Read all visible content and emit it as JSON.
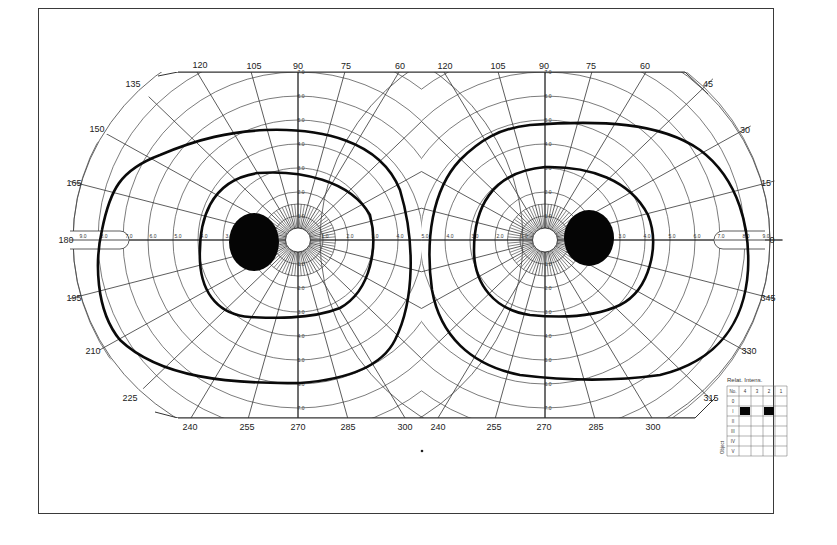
{
  "chart_data": {
    "type": "polar-perimetry",
    "grid": true,
    "eyes": [
      {
        "name": "left-eye-field",
        "center": [
          298,
          240
        ],
        "meridian_labels": [
          "120",
          "105",
          "90",
          "75",
          "60",
          "135",
          "150",
          "165",
          "180",
          "195",
          "210",
          "225",
          "240",
          "255",
          "270",
          "285",
          "300"
        ],
        "radial_ticks_horizontal": [
          "9.0",
          "8.0",
          "7.0",
          "6.0",
          "5.0",
          "4.0",
          "3.0",
          "1.0",
          "2.0",
          "3.0",
          "4.0",
          "5.0"
        ],
        "radial_ticks_vertical": [
          "7.0",
          "6.0",
          "5.0",
          "4.0",
          "3.0",
          "2.0",
          "1.0",
          "1.0",
          "2.0",
          "3.0",
          "4.0",
          "5.0",
          "6.0",
          "7.0"
        ],
        "isopters": [
          {
            "name": "outer-isopter",
            "extent_deg": {
              "temporal": 80,
              "nasal": 45,
              "superior": 45,
              "inferior": 58
            }
          },
          {
            "name": "inner-isopter",
            "extent_deg": {
              "temporal": 40,
              "nasal": 30,
              "superior": 28,
              "inferior": 30
            }
          }
        ],
        "blind_spot": {
          "center_deg": [
            -17,
            0
          ],
          "size_deg": [
            10,
            12
          ]
        }
      },
      {
        "name": "right-eye-field",
        "center": [
          545,
          240
        ],
        "meridian_labels": [
          "120",
          "105",
          "90",
          "75",
          "60",
          "45",
          "30",
          "15",
          "0",
          "345",
          "330",
          "315",
          "240",
          "255",
          "270",
          "285",
          "300"
        ],
        "radial_ticks_horizontal": [
          "4.0",
          "3.0",
          "2.0",
          "1.0",
          "3.0",
          "4.0",
          "5.0",
          "6.0",
          "7.0",
          "8.0",
          "9.0"
        ],
        "radial_ticks_vertical": [
          "7.0",
          "6.0",
          "5.0",
          "4.0",
          "3.0",
          "2.0",
          "1.0",
          "1.0",
          "2.0",
          "3.0",
          "4.0",
          "5.0",
          "6.0",
          "7.0"
        ],
        "isopters": [
          {
            "name": "outer-isopter",
            "extent_deg": {
              "temporal": 80,
              "nasal": 45,
              "superior": 48,
              "inferior": 57
            }
          },
          {
            "name": "inner-isopter",
            "extent_deg": {
              "temporal": 42,
              "nasal": 30,
              "superior": 30,
              "inferior": 30
            }
          }
        ],
        "blind_spot": {
          "center_deg": [
            17,
            0
          ],
          "size_deg": [
            10,
            12
          ]
        }
      }
    ],
    "shared_center_label": "5.0",
    "legend": {
      "title": "Relat. Intens.",
      "columns": [
        "No.",
        "4",
        "3",
        "2",
        "1"
      ],
      "rows": [
        "0",
        "I",
        "II",
        "III",
        "IV",
        "V"
      ],
      "side_label": "Object",
      "filled_cells": [
        [
          "I",
          "4"
        ],
        [
          "I",
          "2"
        ]
      ]
    }
  },
  "labels": {
    "left": {
      "top": [
        {
          "t": "120",
          "x": 200,
          "y": 68
        },
        {
          "t": "105",
          "x": 254,
          "y": 69
        },
        {
          "t": "90",
          "x": 298,
          "y": 69
        },
        {
          "t": "75",
          "x": 346,
          "y": 69
        },
        {
          "t": "60",
          "x": 400,
          "y": 69
        }
      ],
      "side": [
        {
          "t": "135",
          "x": 133,
          "y": 87
        },
        {
          "t": "150",
          "x": 97,
          "y": 132
        },
        {
          "t": "165",
          "x": 74,
          "y": 186
        },
        {
          "t": "180",
          "x": 66,
          "y": 243
        },
        {
          "t": "195",
          "x": 74,
          "y": 301
        },
        {
          "t": "210",
          "x": 93,
          "y": 354
        },
        {
          "t": "225",
          "x": 130,
          "y": 401
        }
      ],
      "bottom": [
        {
          "t": "240",
          "x": 190,
          "y": 430
        },
        {
          "t": "255",
          "x": 247,
          "y": 430
        },
        {
          "t": "270",
          "x": 298,
          "y": 430
        },
        {
          "t": "285",
          "x": 348,
          "y": 430
        },
        {
          "t": "300",
          "x": 405,
          "y": 430
        }
      ]
    },
    "right": {
      "top": [
        {
          "t": "120",
          "x": 445,
          "y": 69
        },
        {
          "t": "105",
          "x": 498,
          "y": 69
        },
        {
          "t": "90",
          "x": 544,
          "y": 69
        },
        {
          "t": "75",
          "x": 591,
          "y": 69
        },
        {
          "t": "60",
          "x": 645,
          "y": 69
        }
      ],
      "side": [
        {
          "t": "45",
          "x": 708,
          "y": 87
        },
        {
          "t": "30",
          "x": 745,
          "y": 133
        },
        {
          "t": "15",
          "x": 766,
          "y": 186
        },
        {
          "t": "0",
          "x": 772,
          "y": 243
        },
        {
          "t": "345",
          "x": 768,
          "y": 301
        },
        {
          "t": "330",
          "x": 749,
          "y": 354
        },
        {
          "t": "315",
          "x": 711,
          "y": 401
        }
      ],
      "bottom": [
        {
          "t": "240",
          "x": 438,
          "y": 430
        },
        {
          "t": "255",
          "x": 494,
          "y": 430
        },
        {
          "t": "270",
          "x": 544,
          "y": 430
        },
        {
          "t": "285",
          "x": 596,
          "y": 430
        },
        {
          "t": "300",
          "x": 653,
          "y": 430
        }
      ]
    }
  }
}
